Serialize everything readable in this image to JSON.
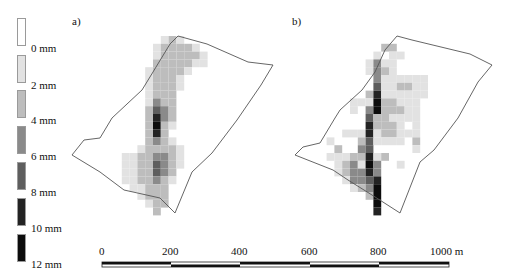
{
  "legend": {
    "items": [
      {
        "label": "0 mm",
        "color": "#ffffff"
      },
      {
        "label": "2 mm",
        "color": "#e2e2e2"
      },
      {
        "label": "4 mm",
        "color": "#bdbdbd"
      },
      {
        "label": "6 mm",
        "color": "#8a8a8a"
      },
      {
        "label": "8 mm",
        "color": "#5e5e5e"
      },
      {
        "label": "10 mm",
        "color": "#232323"
      },
      {
        "label": "12 mm",
        "color": "#0c0c0c"
      }
    ]
  },
  "panels": [
    {
      "label": "a)"
    },
    {
      "label": "b)"
    }
  ],
  "scale_bar": {
    "ticks": [
      "0",
      "200",
      "400",
      "600",
      "800",
      "1000 m"
    ],
    "unit": "m"
  },
  "maps": {
    "a": {
      "description": "Gridded depth field, values in mm (legend levels 0-6 index)",
      "cells": [
        [
          0,
          0,
          0,
          0,
          0,
          0,
          1,
          2,
          1,
          0,
          0,
          0,
          0
        ],
        [
          0,
          0,
          0,
          0,
          0,
          1,
          2,
          2,
          2,
          2,
          1,
          0,
          0
        ],
        [
          0,
          0,
          0,
          0,
          0,
          1,
          2,
          2,
          2,
          2,
          2,
          1,
          0
        ],
        [
          0,
          0,
          0,
          0,
          0,
          2,
          2,
          2,
          2,
          2,
          1,
          1,
          0
        ],
        [
          0,
          0,
          0,
          0,
          1,
          2,
          2,
          2,
          2,
          1,
          0,
          0,
          0
        ],
        [
          0,
          0,
          0,
          0,
          1,
          2,
          2,
          2,
          1,
          0,
          0,
          0,
          0
        ],
        [
          0,
          0,
          0,
          0,
          1,
          2,
          2,
          2,
          1,
          0,
          0,
          0,
          0
        ],
        [
          0,
          0,
          0,
          0,
          1,
          2,
          2,
          2,
          0,
          0,
          0,
          0,
          0
        ],
        [
          0,
          0,
          0,
          0,
          1,
          3,
          2,
          2,
          0,
          0,
          0,
          0,
          0
        ],
        [
          0,
          0,
          0,
          0,
          2,
          4,
          3,
          2,
          0,
          0,
          0,
          0,
          0
        ],
        [
          0,
          0,
          0,
          0,
          2,
          5,
          3,
          2,
          0,
          0,
          0,
          0,
          0
        ],
        [
          0,
          0,
          0,
          0,
          2,
          6,
          2,
          1,
          0,
          0,
          0,
          0,
          0
        ],
        [
          0,
          0,
          0,
          0,
          2,
          5,
          2,
          0,
          0,
          0,
          0,
          0,
          0
        ],
        [
          0,
          0,
          0,
          0,
          2,
          3,
          2,
          1,
          0,
          0,
          0,
          0,
          0
        ],
        [
          0,
          0,
          0,
          1,
          2,
          2,
          2,
          2,
          1,
          0,
          0,
          0,
          0
        ],
        [
          0,
          1,
          1,
          2,
          2,
          3,
          3,
          2,
          1,
          0,
          0,
          0,
          0
        ],
        [
          0,
          1,
          1,
          2,
          2,
          4,
          3,
          2,
          1,
          0,
          0,
          0,
          0
        ],
        [
          0,
          1,
          1,
          2,
          2,
          4,
          3,
          2,
          0,
          0,
          0,
          0,
          0
        ],
        [
          0,
          1,
          1,
          2,
          2,
          3,
          2,
          1,
          0,
          0,
          0,
          0,
          0
        ],
        [
          0,
          0,
          1,
          1,
          2,
          2,
          2,
          0,
          0,
          0,
          0,
          0,
          0
        ],
        [
          0,
          0,
          0,
          1,
          2,
          2,
          2,
          0,
          0,
          0,
          0,
          0,
          0
        ],
        [
          0,
          0,
          0,
          0,
          1,
          2,
          2,
          0,
          0,
          0,
          0,
          0,
          0
        ],
        [
          0,
          0,
          0,
          0,
          0,
          2,
          0,
          0,
          0,
          0,
          0,
          0,
          0
        ]
      ]
    },
    "b": {
      "description": "Gridded depth field, values in mm (legend levels 0-6 index)",
      "cells": [
        [
          0,
          0,
          0,
          0,
          0,
          0,
          0,
          0,
          0,
          0,
          0,
          0,
          0,
          0,
          0,
          0,
          0,
          0
        ],
        [
          0,
          0,
          0,
          0,
          0,
          0,
          0,
          0,
          0,
          2,
          2,
          0,
          0,
          0,
          0,
          0,
          0,
          0
        ],
        [
          0,
          0,
          0,
          0,
          0,
          0,
          0,
          0,
          1,
          0,
          1,
          1,
          0,
          0,
          0,
          0,
          0,
          0
        ],
        [
          0,
          0,
          0,
          0,
          0,
          0,
          0,
          1,
          3,
          1,
          1,
          0,
          0,
          0,
          0,
          0,
          0,
          0
        ],
        [
          0,
          0,
          0,
          0,
          0,
          0,
          0,
          1,
          3,
          2,
          1,
          0,
          0,
          0,
          0,
          0,
          0,
          0
        ],
        [
          0,
          0,
          0,
          0,
          0,
          0,
          0,
          0,
          3,
          1,
          1,
          1,
          1,
          1,
          1,
          0,
          0,
          0
        ],
        [
          0,
          0,
          0,
          0,
          0,
          0,
          0,
          0,
          4,
          1,
          1,
          2,
          2,
          1,
          1,
          0,
          0,
          0
        ],
        [
          0,
          0,
          0,
          0,
          0,
          0,
          0,
          2,
          5,
          1,
          1,
          1,
          1,
          1,
          1,
          0,
          0,
          0
        ],
        [
          0,
          0,
          0,
          0,
          0,
          1,
          1,
          1,
          6,
          2,
          2,
          1,
          1,
          1,
          0,
          0,
          0,
          0
        ],
        [
          0,
          0,
          0,
          0,
          0,
          1,
          0,
          3,
          6,
          2,
          2,
          2,
          1,
          1,
          0,
          0,
          0,
          0
        ],
        [
          0,
          0,
          0,
          0,
          0,
          0,
          0,
          4,
          2,
          2,
          1,
          1,
          1,
          1,
          0,
          0,
          0,
          0
        ],
        [
          0,
          0,
          0,
          0,
          0,
          0,
          0,
          5,
          2,
          2,
          2,
          1,
          0,
          1,
          0,
          0,
          0,
          0
        ],
        [
          0,
          0,
          0,
          0,
          1,
          1,
          1,
          5,
          1,
          2,
          2,
          1,
          1,
          1,
          0,
          0,
          0,
          0
        ],
        [
          0,
          0,
          1,
          0,
          0,
          0,
          2,
          4,
          1,
          1,
          1,
          1,
          0,
          2,
          0,
          0,
          0,
          0
        ],
        [
          0,
          0,
          0,
          2,
          0,
          0,
          3,
          4,
          0,
          0,
          0,
          0,
          0,
          1,
          0,
          0,
          0,
          0
        ],
        [
          0,
          0,
          1,
          1,
          1,
          2,
          2,
          5,
          1,
          2,
          0,
          0,
          0,
          0,
          0,
          0,
          0,
          0
        ],
        [
          0,
          0,
          0,
          1,
          2,
          3,
          1,
          6,
          3,
          0,
          0,
          1,
          0,
          0,
          0,
          0,
          0,
          0
        ],
        [
          0,
          0,
          0,
          1,
          2,
          3,
          3,
          5,
          3,
          0,
          0,
          0,
          0,
          0,
          0,
          0,
          0,
          0
        ],
        [
          0,
          0,
          0,
          0,
          1,
          3,
          3,
          4,
          5,
          0,
          0,
          0,
          0,
          0,
          0,
          0,
          0,
          0
        ],
        [
          0,
          0,
          0,
          0,
          0,
          1,
          2,
          3,
          6,
          0,
          0,
          0,
          0,
          0,
          0,
          0,
          0,
          0
        ],
        [
          0,
          0,
          0,
          0,
          0,
          0,
          0,
          2,
          6,
          0,
          0,
          0,
          0,
          0,
          0,
          0,
          0,
          0
        ],
        [
          0,
          0,
          0,
          0,
          0,
          0,
          0,
          0,
          6,
          0,
          0,
          0,
          0,
          0,
          0,
          0,
          0,
          0
        ],
        [
          0,
          0,
          0,
          0,
          0,
          0,
          0,
          0,
          5,
          0,
          0,
          0,
          0,
          0,
          0,
          0,
          0,
          0
        ]
      ]
    }
  }
}
